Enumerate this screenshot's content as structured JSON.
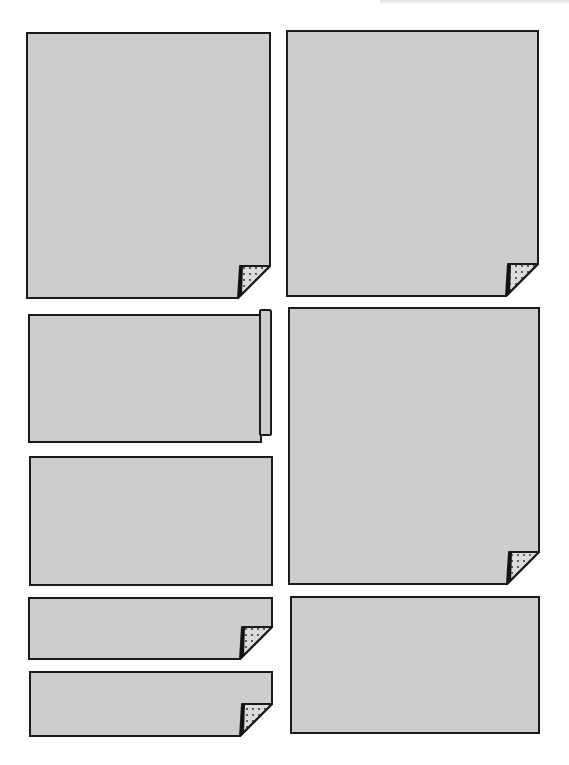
{
  "page": {
    "background": "#ffffff",
    "panel_fill": "#cdcdcd",
    "panel_stroke": "#1a1a1a",
    "curl_fill": "#dcdcdc"
  },
  "panels": [
    {
      "id": "panel-1",
      "x": 27,
      "y": 33,
      "w": 243,
      "h": 265,
      "effect": "page-curl"
    },
    {
      "id": "panel-2",
      "x": 287,
      "y": 31,
      "w": 251,
      "h": 265,
      "effect": "page-curl"
    },
    {
      "id": "panel-3",
      "x": 28,
      "y": 314,
      "w": 234,
      "h": 129,
      "effect": "rolled-edge"
    },
    {
      "id": "panel-4",
      "x": 289,
      "y": 308,
      "w": 250,
      "h": 276,
      "effect": "page-curl"
    },
    {
      "id": "panel-5",
      "x": 29,
      "y": 456,
      "w": 244,
      "h": 130,
      "effect": "none"
    },
    {
      "id": "panel-6",
      "x": 29,
      "y": 598,
      "w": 243,
      "h": 61,
      "effect": "page-curl"
    },
    {
      "id": "panel-7",
      "x": 30,
      "y": 672,
      "w": 242,
      "h": 64,
      "effect": "page-curl"
    },
    {
      "id": "panel-8",
      "x": 290,
      "y": 596,
      "w": 250,
      "h": 138,
      "effect": "none"
    }
  ]
}
